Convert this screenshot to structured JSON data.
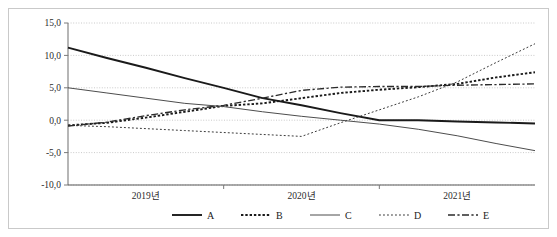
{
  "chart_data": {
    "type": "line",
    "title": "",
    "subtitle": "",
    "xlabel": "",
    "ylabel": "",
    "xlim": [
      0,
      12
    ],
    "ylim": [
      -10.0,
      15.0
    ],
    "grid": true,
    "grid_axis": "y",
    "legend_position": "bottom",
    "x_tick_labels": [
      "2019년",
      "2020년",
      "2021년"
    ],
    "y_tick_labels": [
      "15,0",
      "10,0",
      "5,0",
      "0,0",
      "-5,0",
      "-10,0"
    ],
    "y_tick_values": [
      15.0,
      10.0,
      5.0,
      0.0,
      -5.0,
      -10.0
    ],
    "x": [
      0,
      1,
      2,
      3,
      4,
      5,
      6,
      7,
      8,
      9,
      10,
      11,
      12
    ],
    "series": [
      {
        "name": "A",
        "style": "solid",
        "width": "thick",
        "color": "#1a1a1a",
        "values": [
          11.2,
          9.6,
          8.1,
          6.5,
          5.0,
          3.4,
          2.3,
          1.1,
          0.0,
          0.0,
          -0.2,
          -0.35,
          -0.5
        ]
      },
      {
        "name": "B",
        "style": "dotted",
        "width": "thick",
        "color": "#1a1a1a",
        "values": [
          -0.8,
          -0.4,
          0.4,
          1.3,
          2.2,
          2.6,
          3.4,
          4.2,
          4.7,
          5.1,
          5.6,
          6.6,
          7.4
        ]
      },
      {
        "name": "C",
        "style": "solid",
        "width": "thin",
        "color": "#4d4d4d",
        "values": [
          5.0,
          4.2,
          3.4,
          2.6,
          2.1,
          1.3,
          0.6,
          0.0,
          -0.6,
          -1.4,
          -2.4,
          -3.6,
          -4.7
        ]
      },
      {
        "name": "D",
        "style": "dotted",
        "width": "thin",
        "color": "#3a3a3a",
        "values": [
          -0.8,
          -1.0,
          -1.3,
          -1.6,
          -1.9,
          -2.2,
          -2.5,
          -0.4,
          1.6,
          3.6,
          5.9,
          8.9,
          11.8
        ]
      },
      {
        "name": "E",
        "style": "dashdot",
        "width": "medium",
        "color": "#2b2b2b",
        "values": [
          -0.9,
          -0.3,
          0.7,
          1.6,
          2.3,
          3.4,
          4.6,
          5.1,
          5.2,
          5.2,
          5.4,
          5.5,
          5.6
        ]
      }
    ]
  },
  "legend": {
    "items": [
      {
        "label": "A",
        "swatch": "line-solid-thick"
      },
      {
        "label": "B",
        "swatch": "line-dotted-thick"
      },
      {
        "label": "C",
        "swatch": "line-solid-thin"
      },
      {
        "label": "D",
        "swatch": "line-dotted-thin"
      },
      {
        "label": "E",
        "swatch": "line-dashdot"
      }
    ]
  },
  "colors": {
    "frame_border": "#c9c9c9",
    "gridline": "#bcbcbc",
    "axis": "#7a7a7a",
    "text": "#1a1a1a"
  }
}
